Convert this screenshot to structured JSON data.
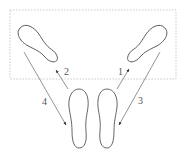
{
  "diagram": {
    "colors": {
      "stroke": "#555555",
      "zone_border": "#bbbbbb",
      "background": "#ffffff"
    },
    "zone": {
      "style": "dashed",
      "x": 10,
      "y": 10,
      "w": 166,
      "h": 69
    },
    "footprints": [
      {
        "id": "left-forward",
        "position": "top-left"
      },
      {
        "id": "right-forward",
        "position": "top-right"
      },
      {
        "id": "left-start",
        "position": "bottom-left"
      },
      {
        "id": "right-start",
        "position": "bottom-right"
      }
    ],
    "steps": [
      {
        "label": "1",
        "from": "right-start",
        "to": "right-forward"
      },
      {
        "label": "2",
        "from": "left-start",
        "to": "left-forward"
      },
      {
        "label": "3",
        "from": "right-forward",
        "to": "right-start"
      },
      {
        "label": "4",
        "from": "left-forward",
        "to": "left-start"
      }
    ]
  }
}
